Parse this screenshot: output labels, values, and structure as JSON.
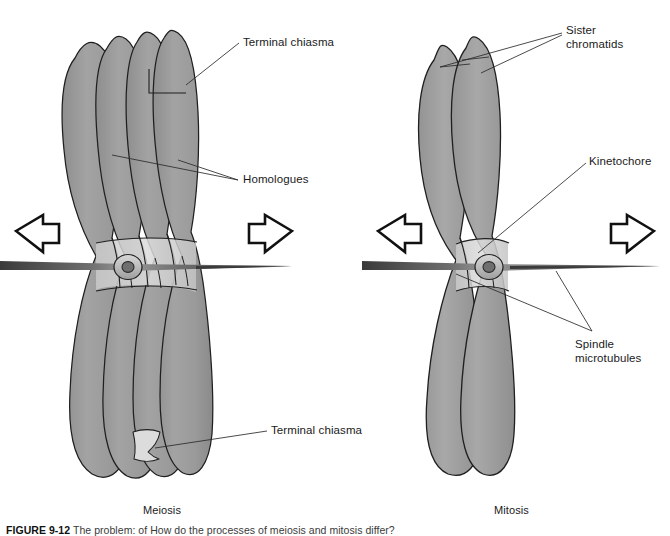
{
  "figure": {
    "caption_label": "FIGURE 9-12",
    "caption_text": "The problem: of How do the processes of meiosis and mitosis differ?",
    "background_color": "#ffffff",
    "chromatid_fill": "#9c9c9c",
    "chromatid_fill_light": "#b5b5b5",
    "centromere_fill": "#b0b0b0",
    "outline_color": "#1f1f1f",
    "spindle_color": "#5a5a5a",
    "chiasma_fill": "#d9d9d9"
  },
  "panels": [
    {
      "id": "meiosis",
      "caption": "Meiosis",
      "caption_x": 143,
      "caption_y": 504,
      "arrows": [
        {
          "name": "left-pull-arrow",
          "direction": "left"
        },
        {
          "name": "right-pull-arrow",
          "direction": "right"
        }
      ],
      "structures": {
        "chromatid_count": 4,
        "homologue_count": 2,
        "centromere": "centromere",
        "spindle": "spindle-microtubules"
      },
      "labels": [
        {
          "name": "terminal-chiasma-top",
          "text": "Terminal chiasma",
          "x": 243,
          "y": 36
        },
        {
          "name": "homologues",
          "text": "Homologues",
          "x": 243,
          "y": 173
        },
        {
          "name": "terminal-chiasma-bottom",
          "text": "Terminal chiasma",
          "x": 271,
          "y": 424
        }
      ]
    },
    {
      "id": "mitosis",
      "caption": "Mitosis",
      "caption_x": 494,
      "caption_y": 504,
      "arrows": [
        {
          "name": "left-pull-arrow",
          "direction": "left"
        },
        {
          "name": "right-pull-arrow",
          "direction": "right"
        }
      ],
      "structures": {
        "chromatid_count": 2,
        "homologue_count": 1,
        "centromere": "kinetochore",
        "spindle": "spindle-microtubules"
      },
      "labels": [
        {
          "name": "sister-chromatids",
          "text": "Sister\nchromatids",
          "x": 566,
          "y": 24
        },
        {
          "name": "kinetochore",
          "text": "Kinetochore",
          "x": 589,
          "y": 155
        },
        {
          "name": "spindle-microtubules",
          "text": "Spindle\nmicrotubules",
          "x": 575,
          "y": 338
        }
      ]
    }
  ]
}
